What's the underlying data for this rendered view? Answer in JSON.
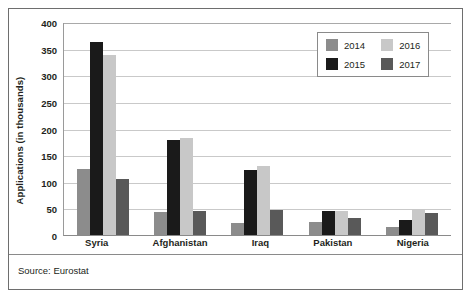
{
  "chart_data": {
    "type": "bar",
    "title": "",
    "subtitle": "",
    "xlabel": "",
    "ylabel": "Applications (in thousands)",
    "ylim": [
      0,
      400
    ],
    "ytick_step": 50,
    "yticks": [
      "400",
      "350",
      "300",
      "250",
      "200",
      "150",
      "100",
      "50",
      "0"
    ],
    "grid": true,
    "legend_position": "top-right",
    "categories": [
      "Syria",
      "Afghanistan",
      "Iraq",
      "Pakistan",
      "Nigeria"
    ],
    "series": [
      {
        "name": "2014",
        "color": "#8c8c8c",
        "values": [
          124,
          44,
          22,
          25,
          15
        ]
      },
      {
        "name": "2015",
        "color": "#1a1a1a",
        "values": [
          363,
          178,
          123,
          45,
          28
        ]
      },
      {
        "name": "2016",
        "color": "#c8c8c8",
        "values": [
          338,
          182,
          130,
          45,
          48
        ]
      },
      {
        "name": "2017",
        "color": "#595959",
        "values": [
          106,
          46,
          47,
          32,
          42
        ]
      }
    ],
    "source": "Source: Eurostat"
  },
  "legend": {
    "entries": [
      {
        "label": "2014",
        "color": "#8c8c8c"
      },
      {
        "label": "2016",
        "color": "#c8c8c8"
      },
      {
        "label": "2015",
        "color": "#1a1a1a"
      },
      {
        "label": "2017",
        "color": "#595959"
      }
    ]
  }
}
